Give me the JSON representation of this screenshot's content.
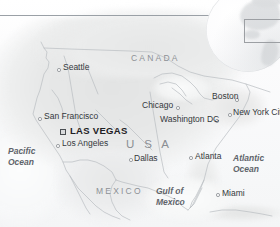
{
  "map": {
    "title": "Las Vegas location map of the United States",
    "projection_note": "Continental United States with neighbouring Canada and Mexico",
    "background_color": "#fdfdfd",
    "land_color": "#e9eaea",
    "line_color": "#9aa0a6",
    "highlight_city": "LAS VEGAS"
  },
  "inset": {
    "name": "globe-inset",
    "description": "Shaded relief globe showing North America with a rectangular locator frame over the United States",
    "frame_label": "locator-frame"
  },
  "rule": {
    "name": "top-divider",
    "color": "#9aa0a6"
  },
  "countries": [
    {
      "label": "CANADA",
      "x": 131,
      "y": 54,
      "style": "country"
    },
    {
      "label": "U S A",
      "x": 126,
      "y": 139,
      "style": "usa"
    },
    {
      "label": "MEXICO",
      "x": 96,
      "y": 187,
      "style": "country"
    }
  ],
  "oceans": [
    {
      "line1": "Pacific",
      "line2": "Ocean",
      "x": 8,
      "y": 146
    },
    {
      "line1": "Atlantic",
      "line2": "Ocean",
      "x": 233,
      "y": 153
    },
    {
      "line1": "Gulf of",
      "line2": "Mexico",
      "x": 156,
      "y": 186
    }
  ],
  "cities": [
    {
      "name": "Seattle",
      "label_x": 63,
      "label_y": 67,
      "dot_x": 57,
      "dot_y": 68,
      "highlight": false
    },
    {
      "name": "San Francisco",
      "label_x": 44,
      "label_y": 116,
      "dot_x": 38,
      "dot_y": 117,
      "highlight": false
    },
    {
      "name": "LAS VEGAS",
      "label_x": 70,
      "label_y": 128,
      "dot_x": 60,
      "dot_y": 129,
      "highlight": true
    },
    {
      "name": "Los Angeles",
      "label_x": 62,
      "label_y": 143,
      "dot_x": 56,
      "dot_y": 144,
      "highlight": false
    },
    {
      "name": "Chicago",
      "label_x": 142,
      "label_y": 104,
      "dot_x": 176,
      "dot_y": 106,
      "highlight": false
    },
    {
      "name": "Boston",
      "label_x": 212,
      "label_y": 95,
      "dot_x": 235,
      "dot_y": 98,
      "highlight": false
    },
    {
      "name": "New York City",
      "label_x": 233,
      "label_y": 112,
      "dot_x": 228,
      "dot_y": 113,
      "highlight": false
    },
    {
      "name": "Washington DC",
      "label_x": 160,
      "label_y": 118,
      "dot_x": 215,
      "dot_y": 119,
      "highlight": false
    },
    {
      "name": "Dallas",
      "label_x": 134,
      "label_y": 157,
      "dot_x": 129,
      "dot_y": 158,
      "highlight": false
    },
    {
      "name": "Atlanta",
      "label_x": 195,
      "label_y": 155,
      "dot_x": 189,
      "dot_y": 156,
      "highlight": false
    },
    {
      "name": "Miami",
      "label_x": 222,
      "label_y": 192,
      "dot_x": 216,
      "dot_y": 193,
      "highlight": false
    }
  ]
}
